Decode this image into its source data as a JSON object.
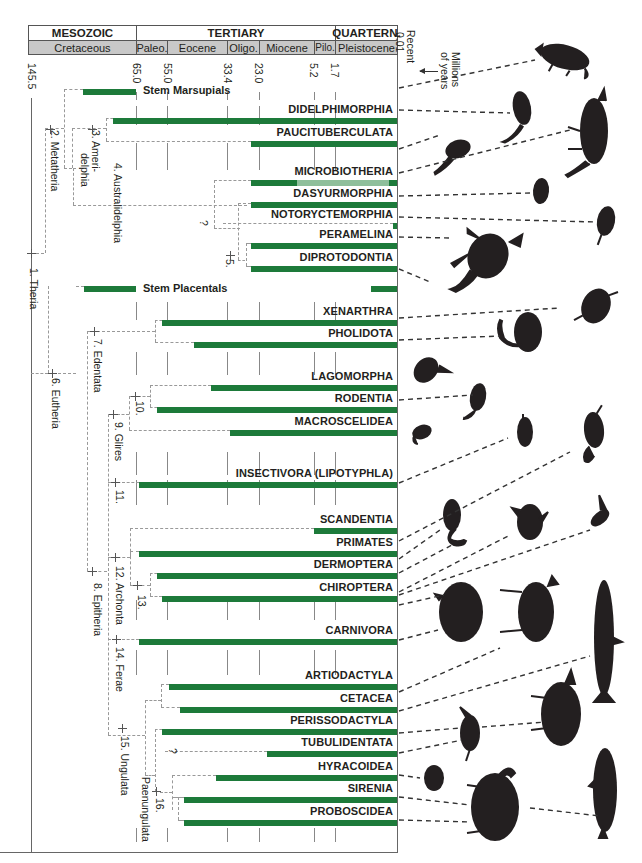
{
  "header": {
    "eras": [
      {
        "label": "MESOZOIC"
      },
      {
        "label": "TERTIARY"
      },
      {
        "label": "QUARTERN."
      }
    ],
    "periods": [
      {
        "label": "Cretaceous"
      },
      {
        "label": "Paleo."
      },
      {
        "label": "Eocene"
      },
      {
        "label": "Oligo."
      },
      {
        "label": "Miocene"
      },
      {
        "label": "Pilo."
      },
      {
        "label": "Pleistocene"
      }
    ],
    "recent_label": "Recent",
    "recent_value": "0.01",
    "axis_unit": "Millions of years",
    "axis_unit_line1": "Millions",
    "axis_unit_line2": "of years",
    "arrow_icon": "arrow-left-icon"
  },
  "chart_data": {
    "type": "phylogenetic-timeline",
    "title": "",
    "xlabel": "Millions of years",
    "time_ticks": [
      "145.5",
      "65.0",
      "55.0",
      "33.4",
      "23.0",
      "5.2",
      "1.7"
    ],
    "recent": "0.01",
    "grid": true,
    "stem_groups": [
      {
        "name": "Stem Marsupials",
        "start_ma": 80,
        "end_ma": 65.0
      },
      {
        "name": "Stem Placentals",
        "start_ma": 80,
        "end_ma": 65.0
      }
    ],
    "taxa": [
      {
        "name": "DIDELPHIMORPHIA",
        "start_ma": 70,
        "end_ma": 0,
        "group": "Metatheria"
      },
      {
        "name": "PAUCITUBERCULATA",
        "start_ma": 25,
        "end_ma": 0,
        "group": "Metatheria"
      },
      {
        "name": "MICROBIOTHERIA",
        "start_ma": 25,
        "end_ma": 0,
        "fossil_gap_start_ma": 18,
        "fossil_gap_end_ma": 1,
        "group": "Metatheria"
      },
      {
        "name": "DASYURMORPHIA",
        "start_ma": 25,
        "end_ma": 0,
        "group": "Metatheria"
      },
      {
        "name": "NOTORYCTEMORPHIA",
        "start_ma": 1,
        "end_ma": 0,
        "uncertain": true,
        "group": "Metatheria"
      },
      {
        "name": "PERAMELINA",
        "start_ma": 25,
        "end_ma": 0,
        "group": "Metatheria"
      },
      {
        "name": "DIPROTODONTIA",
        "start_ma": 25,
        "end_ma": 0,
        "group": "Metatheria"
      },
      {
        "name": "XENARTHRA",
        "start_ma": 60,
        "end_ma": 0,
        "group": "Eutheria"
      },
      {
        "name": "PHOLIDOTA",
        "start_ma": 50,
        "end_ma": 0,
        "group": "Eutheria"
      },
      {
        "name": "LAGOMORPHA",
        "start_ma": 40,
        "end_ma": 0,
        "group": "Eutheria"
      },
      {
        "name": "RODENTIA",
        "start_ma": 60,
        "end_ma": 0,
        "group": "Eutheria"
      },
      {
        "name": "MACROSCELIDEA",
        "start_ma": 35,
        "end_ma": 0,
        "group": "Eutheria"
      },
      {
        "name": "INSECTIVORA (LIPOTYPHLA)",
        "start_ma": 65,
        "end_ma": 0,
        "group": "Eutheria"
      },
      {
        "name": "SCANDENTIA",
        "start_ma": 10,
        "end_ma": 0,
        "group": "Eutheria"
      },
      {
        "name": "PRIMATES",
        "start_ma": 65,
        "end_ma": 0,
        "group": "Eutheria"
      },
      {
        "name": "DERMOPTERA",
        "start_ma": 60,
        "end_ma": 0,
        "group": "Eutheria"
      },
      {
        "name": "CHIROPTERA",
        "start_ma": 58,
        "end_ma": 0,
        "group": "Eutheria"
      },
      {
        "name": "CARNIVORA",
        "start_ma": 65,
        "end_ma": 0,
        "group": "Eutheria"
      },
      {
        "name": "ARTIODACTYLA",
        "start_ma": 55,
        "end_ma": 0,
        "group": "Eutheria"
      },
      {
        "name": "CETACEA",
        "start_ma": 52,
        "end_ma": 0,
        "group": "Eutheria"
      },
      {
        "name": "PERISSODACTYLA",
        "start_ma": 58,
        "end_ma": 0,
        "group": "Eutheria"
      },
      {
        "name": "TUBULIDENTATA",
        "start_ma": 20,
        "end_ma": 0,
        "uncertain": true,
        "group": "Eutheria"
      },
      {
        "name": "HYRACOIDEA",
        "start_ma": 40,
        "end_ma": 0,
        "group": "Eutheria"
      },
      {
        "name": "SIRENIA",
        "start_ma": 50,
        "end_ma": 0,
        "group": "Eutheria"
      },
      {
        "name": "PROBOSCIDEA",
        "start_ma": 50,
        "end_ma": 0,
        "group": "Eutheria"
      }
    ],
    "clades": [
      "1. Theria",
      "2. Metatheria",
      "3. Ameri-delphia",
      "4. Australidelphia",
      "5.",
      "6. Eutheria",
      "7. Edentata",
      "8. Epitheria",
      "9. Glires",
      "10.",
      "11.",
      "12. Archonta",
      "13.",
      "14. Ferae",
      "15. Ungulata",
      "16.",
      "Paenungulata"
    ]
  },
  "ticks": [
    {
      "label": "145.5"
    },
    {
      "label": "65.0"
    },
    {
      "label": "55.0"
    },
    {
      "label": "33.4"
    },
    {
      "label": "23.0"
    },
    {
      "label": "5.2"
    },
    {
      "label": "1.7"
    }
  ],
  "stems": [
    {
      "label": "Stem Marsupials"
    },
    {
      "label": "Stem Placentals"
    }
  ],
  "taxa": [
    {
      "label": "DIDELPHIMORPHIA"
    },
    {
      "label": "PAUCITUBERCULATA"
    },
    {
      "label": "MICROBIOTHERIA"
    },
    {
      "label": "DASYURMORPHIA"
    },
    {
      "label": "NOTORYCTEMORPHIA"
    },
    {
      "label": "PERAMELINA"
    },
    {
      "label": "DIPROTODONTIA"
    },
    {
      "label": "XENARTHRA"
    },
    {
      "label": "PHOLIDOTA"
    },
    {
      "label": "LAGOMORPHA"
    },
    {
      "label": "RODENTIA"
    },
    {
      "label": "MACROSCELIDEA"
    },
    {
      "label": "INSECTIVORA (LIPOTYPHLA)"
    },
    {
      "label": "SCANDENTIA"
    },
    {
      "label": "PRIMATES"
    },
    {
      "label": "DERMOPTERA"
    },
    {
      "label": "CHIROPTERA"
    },
    {
      "label": "CARNIVORA"
    },
    {
      "label": "ARTIODACTYLA"
    },
    {
      "label": "CETACEA"
    },
    {
      "label": "PERISSODACTYLA"
    },
    {
      "label": "TUBULIDENTATA"
    },
    {
      "label": "HYRACOIDEA"
    },
    {
      "label": "SIRENIA"
    },
    {
      "label": "PROBOSCIDEA"
    }
  ],
  "nodes": {
    "n1": "1. Theria",
    "n2": "2. Metatheria",
    "n3a": "3. Ameri-",
    "n3b": "delphia",
    "n4": "4. Australidelphia",
    "n5": "5.",
    "n6": "6. Eutheria",
    "n7": "7. Edentata",
    "n8": "8. Epitheria",
    "n9": "9. Glires",
    "n10": "10.",
    "n11": "11.",
    "n12": "12. Archonta",
    "n13": "13.",
    "n14": "14. Ferae",
    "n15": "15. Ungulata",
    "n16": "16.",
    "paen": "Paenungulata",
    "q1": "?",
    "q2": "?"
  },
  "colors": {
    "bar": "#1d7a3a",
    "bar_light": "#8fbf9b",
    "period_fill": "#c8c8c8",
    "dashed": "#999999",
    "silhouette": "#231f20"
  },
  "silhouettes": [
    "opossum-icon",
    "shrew-opossum-icon",
    "thylacine-icon",
    "monito-del-monte-icon",
    "marsupial-mole-icon",
    "dunnart-icon",
    "bandicoot-icon",
    "kangaroo-icon",
    "armadillo-icon",
    "pangolin-icon",
    "rabbit-icon",
    "rat-icon",
    "elephant-shrew-icon",
    "shrew-icon",
    "tree-shrew-icon",
    "monkey-icon",
    "colugo-icon",
    "bat-icon",
    "bear-icon",
    "camel-icon",
    "whale-icon",
    "rhinoceros-icon",
    "aardvark-icon",
    "hyrax-icon",
    "manatee-icon",
    "elephant-icon"
  ]
}
